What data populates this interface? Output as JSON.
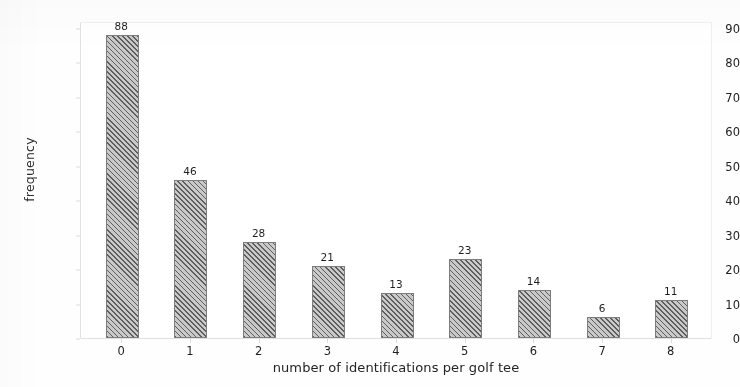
{
  "chart_data": {
    "type": "bar",
    "title": "",
    "subtitle": "",
    "xlabel": "number of identifications per golf tee",
    "ylabel": "frequency",
    "categories": [
      "0",
      "1",
      "2",
      "3",
      "4",
      "5",
      "6",
      "7",
      "8"
    ],
    "values": [
      88,
      46,
      28,
      21,
      13,
      23,
      14,
      6,
      11
    ],
    "data_labels": [
      "88",
      "46",
      "28",
      "21",
      "13",
      "23",
      "14",
      "6",
      "11"
    ],
    "ylim": [
      0,
      92
    ],
    "yticks": [
      "0",
      "10",
      "20",
      "30",
      "40",
      "50",
      "60",
      "70",
      "80",
      "90"
    ],
    "ytick_values": [
      0,
      10,
      20,
      30,
      40,
      50,
      60,
      70,
      80,
      90
    ],
    "xlim": [
      -0.6,
      8.6
    ],
    "grid": false,
    "legend": null,
    "legend_position": "none",
    "bar_face_color": "#9b9b9b",
    "bar_hatch_color": "#5e5e5e",
    "bar_edge_color": "#7d7d7d",
    "bar_hatch": "diagonal-forward",
    "background_color": "#ffffff",
    "text_color": "#222222"
  }
}
